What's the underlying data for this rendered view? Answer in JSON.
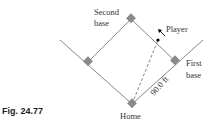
{
  "figure": {
    "caption": "Fig. 24.77",
    "labels": {
      "second_base_line1": "Second",
      "second_base_line2": "base",
      "first_base_line1": "First",
      "first_base_line2": "base",
      "home": "Home",
      "player": "Player",
      "distance": "90.0 ft"
    },
    "colors": {
      "lines": "#888888",
      "bases": "#8a8a8a",
      "text": "#333333"
    }
  }
}
